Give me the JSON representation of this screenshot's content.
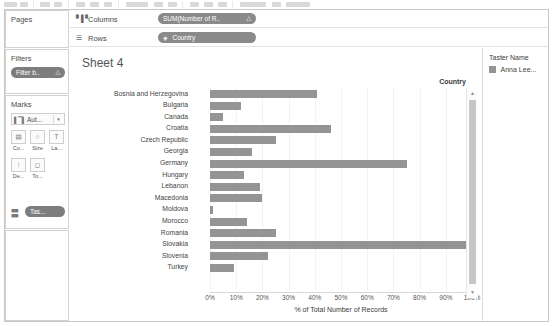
{
  "toolbar": {
    "present": true
  },
  "cards": {
    "pages": {
      "title": "Pages"
    },
    "filters": {
      "title": "Filters",
      "pill": {
        "label": "Filter b..",
        "icon": "triangle-icon"
      }
    },
    "marks": {
      "title": "Marks",
      "mark_type": {
        "label": "Aut...",
        "icon": "bar-mark-icon",
        "caret": "▾"
      },
      "buttons": [
        {
          "name": "color",
          "label": "Co...",
          "icon": "color-icon"
        },
        {
          "name": "size",
          "label": "Size",
          "icon": "size-icon"
        },
        {
          "name": "label",
          "label": "La...",
          "icon": "label-icon"
        },
        {
          "name": "detail",
          "label": "De...",
          "icon": "detail-icon"
        },
        {
          "name": "tooltip",
          "label": "To...",
          "icon": "tooltip-icon"
        }
      ],
      "assigned_pill": {
        "label": "Tas...",
        "icon": "color-dots-icon"
      }
    }
  },
  "shelves": {
    "columns": {
      "label": "Columns",
      "icon": "columns-icon",
      "pill": {
        "label": "SUM(Number of R..",
        "icon": "triangle-icon"
      }
    },
    "rows": {
      "label": "Rows",
      "icon": "rows-icon",
      "pill": {
        "label": "Country",
        "icon": "globe-icon"
      }
    }
  },
  "sheet": {
    "title": "Sheet 4"
  },
  "legend": {
    "title": "Taster Name",
    "items": [
      {
        "label": "Anna Lee...",
        "color": "#949494"
      }
    ]
  },
  "scrollbar": {
    "up": "▲",
    "down": "▼"
  },
  "chart_data": {
    "type": "bar",
    "orientation": "horizontal",
    "title": "Sheet 4",
    "ylabel": "Country",
    "xlabel": "% of Total Number of Records",
    "categories": [
      "Bosnia and Herzegovina",
      "Bulgaria",
      "Canada",
      "Croatia",
      "Czech Republic",
      "Georgia",
      "Germany",
      "Hungary",
      "Lebanon",
      "Macedonia",
      "Moldova",
      "Morocco",
      "Romania",
      "Slovakia",
      "Slovenia",
      "Turkey"
    ],
    "values": [
      41,
      12,
      5,
      46,
      25,
      16,
      75,
      13,
      19,
      20,
      1,
      14,
      25,
      100,
      22,
      9
    ],
    "xlim": [
      0,
      100
    ],
    "xticks": [
      0,
      10,
      20,
      30,
      40,
      50,
      60,
      70,
      80,
      90,
      100
    ],
    "xticklabels": [
      "0%",
      "10%",
      "20%",
      "30%",
      "40%",
      "50%",
      "60%",
      "70%",
      "80%",
      "90%",
      "100%"
    ],
    "grid": true,
    "bar_color": "#949494",
    "legend_position": "right",
    "series": [
      {
        "name": "Anna Lee...",
        "color": "#949494",
        "values": [
          41,
          12,
          5,
          46,
          25,
          16,
          75,
          13,
          19,
          20,
          1,
          14,
          25,
          100,
          22,
          9
        ]
      }
    ]
  }
}
